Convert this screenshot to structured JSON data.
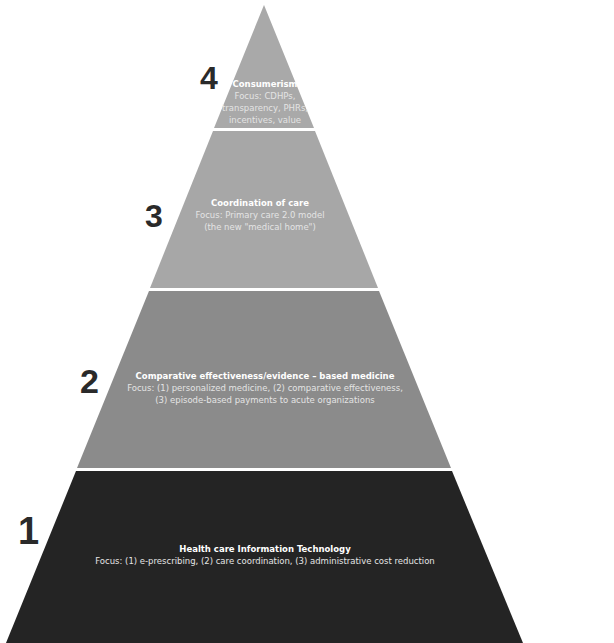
{
  "diagram": {
    "type": "pyramid",
    "colors": {
      "tier4": "#a9a9a9",
      "tier3": "#a7a7a7",
      "tier2": "#8b8b8b",
      "tier1": "#242424",
      "separator": "#ffffff",
      "number": "#2a2a2a"
    },
    "tiers": [
      {
        "number": "1",
        "title": "Health care Information Technology",
        "focus": "Focus: (1) e-prescribing, (2) care coordination, (3) administrative cost reduction"
      },
      {
        "number": "2",
        "title": "Comparative effectiveness/evidence – based medicine",
        "focus_line1": "Focus: (1) personalized medicine, (2) comparative effectiveness,",
        "focus_line2": "(3) episode-based payments to acute organizations"
      },
      {
        "number": "3",
        "title": "Coordination of care",
        "focus_line1": "Focus: Primary care 2.0 model",
        "focus_line2": "(the new \"medical home\")"
      },
      {
        "number": "4",
        "title": "Consumerism",
        "focus_line1": "Focus: CDHPs,",
        "focus_line2": "transparency, PHRs,",
        "focus_line3": "incentives, value"
      }
    ]
  }
}
